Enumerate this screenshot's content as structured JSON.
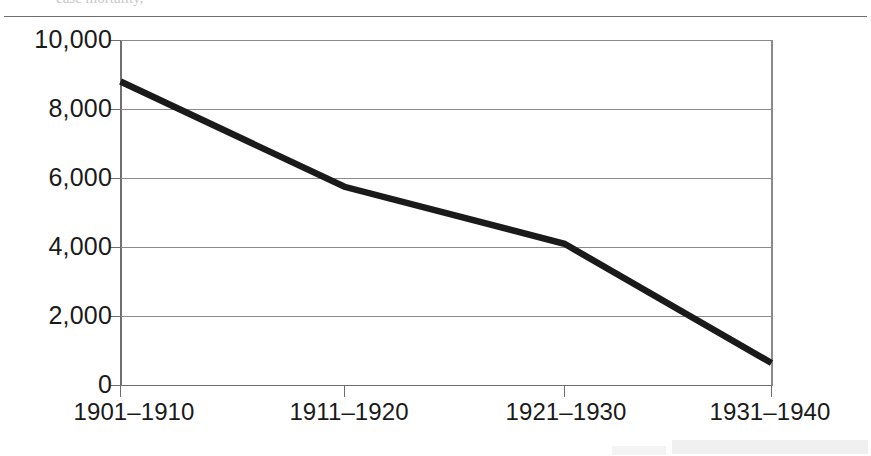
{
  "page": {
    "cut_off_text_top": "case mortality,",
    "scan_artifact": "scan-smudge"
  },
  "chart_data": {
    "type": "line",
    "title": "",
    "subtitle": "",
    "xlabel": "",
    "ylabel": "",
    "categories": [
      "1901–1910",
      "1911–1920",
      "1921–1930",
      "1931–1940"
    ],
    "values": [
      8800,
      5750,
      4100,
      650
    ],
    "series": [
      {
        "name": "",
        "values": [
          8800,
          5750,
          4100,
          650
        ]
      }
    ],
    "ylim": [
      0,
      10000
    ],
    "yticks": [
      0,
      2000,
      4000,
      6000,
      8000,
      10000
    ],
    "ytick_labels": [
      "0",
      "2,000",
      "4,000",
      "6,000",
      "8,000",
      "10,000"
    ],
    "xtick_labels": [
      "1901–1910",
      "1911–1920",
      "1921–1930",
      "1931–1940"
    ],
    "grid": "horizontal",
    "legend": "none",
    "line_color": "#1a1a1a",
    "grid_color": "#808080",
    "axis_color": "#707070",
    "background_color": "#ffffff"
  }
}
